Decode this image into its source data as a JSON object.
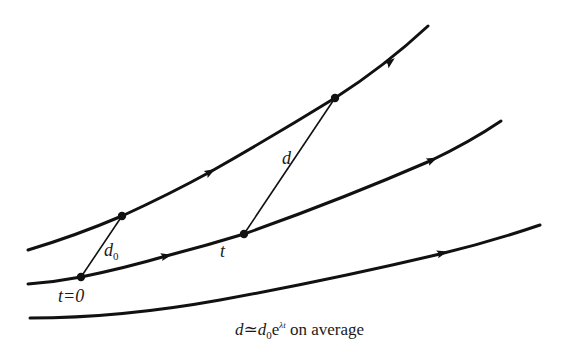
{
  "diagram": {
    "colors": {
      "stroke": "#111111",
      "background": "#ffffff",
      "text": "#1a1a1a"
    },
    "trajectories": [
      {
        "id": "trajectory-1",
        "path": "M28,250 Q75,236 122,216 Q170,194 210,172 Q275,135 335,98 Q385,66 428,26",
        "arrows": [
          [
            210,
            172,
            -29
          ],
          [
            390,
            62,
            -38
          ]
        ]
      },
      {
        "id": "trajectory-2",
        "path": "M28,284 Q55,282 81,277 Q125,268 166,256 Q205,246 244,234 Q340,200 430,161 Q470,142 501,121",
        "arrows": [
          [
            166,
            256,
            -13
          ],
          [
            432,
            160,
            -24
          ]
        ]
      },
      {
        "id": "trajectory-3",
        "path": "M30,318 Q120,318 220,300 Q330,280 440,254 Q490,242 540,225",
        "arrows": [
          [
            442,
            253,
            -15
          ]
        ]
      }
    ],
    "points": [
      {
        "id": "point-t0-traj2",
        "x": 81,
        "y": 277
      },
      {
        "id": "point-t0-traj1",
        "x": 122,
        "y": 216
      },
      {
        "id": "point-t-traj2",
        "x": 244,
        "y": 234
      },
      {
        "id": "point-t-traj1",
        "x": 335,
        "y": 98
      }
    ],
    "segments": [
      {
        "id": "segment-d0",
        "x1": 81,
        "y1": 277,
        "x2": 122,
        "y2": 216
      },
      {
        "id": "segment-d",
        "x1": 244,
        "y1": 234,
        "x2": 335,
        "y2": 98
      }
    ],
    "labels": {
      "d0_main": "d",
      "d0_sub": "0",
      "d": "d",
      "t": "t",
      "t0": "t=0",
      "formula_d": "d",
      "formula_approx": "≃",
      "formula_d0": "d",
      "formula_d0_sub": "0",
      "formula_e": "e",
      "formula_exp": "λt",
      "formula_suffix": " on average"
    }
  }
}
